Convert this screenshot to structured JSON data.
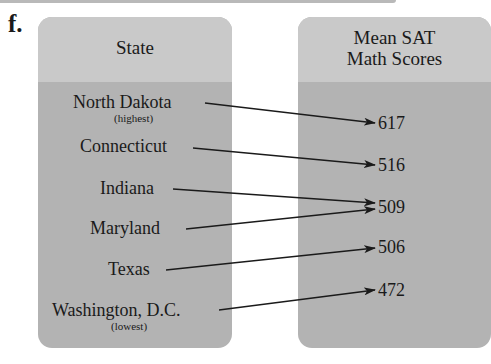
{
  "exercise_label": "f.",
  "left_panel": {
    "title": "State",
    "states": [
      {
        "name": "North Dakota",
        "note": "(highest)"
      },
      {
        "name": "Connecticut"
      },
      {
        "name": "Indiana"
      },
      {
        "name": "Maryland"
      },
      {
        "name": "Texas"
      },
      {
        "name": "Washington, D.C.",
        "note": "(lowest)"
      }
    ]
  },
  "right_panel": {
    "title_line1": "Mean SAT",
    "title_line2": "Math Scores",
    "scores": [
      "617",
      "516",
      "509",
      "506",
      "472"
    ]
  },
  "mapping": [
    {
      "from": "North Dakota",
      "to": "617"
    },
    {
      "from": "Connecticut",
      "to": "516"
    },
    {
      "from": "Indiana",
      "to": "509"
    },
    {
      "from": "Maryland",
      "to": "509"
    },
    {
      "from": "Texas",
      "to": "506"
    },
    {
      "from": "Washington, D.C.",
      "to": "472"
    }
  ],
  "colors": {
    "panel": "#b3b3b3",
    "panel_header": "#c9c9c9",
    "arrow": "#1a1a1a"
  }
}
